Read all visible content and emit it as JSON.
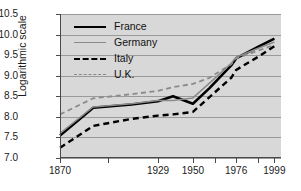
{
  "chart_data": {
    "type": "line",
    "title": "",
    "xlabel": "",
    "ylabel": "Logarithmic scale",
    "grid": true,
    "legend_position": "top-left",
    "ylim": [
      7.0,
      10.5
    ],
    "yticks": [
      "7.0",
      "7.5",
      "8.0",
      "8.5",
      "9.0",
      "9.5",
      "10.0",
      "10.5"
    ],
    "ytick_values": [
      7.0,
      7.5,
      8.0,
      8.5,
      9.0,
      9.5,
      10.0,
      10.5
    ],
    "xticks": [
      "1870",
      "1929",
      "1950",
      "1976",
      "1999"
    ],
    "xtick_values": [
      1870,
      1929,
      1950,
      1976,
      1999
    ],
    "x": [
      1870,
      1890,
      1913,
      1929,
      1938,
      1950,
      1960,
      1973,
      1976,
      1990,
      1999
    ],
    "series": [
      {
        "name": "France",
        "color": "#000000",
        "style": "solid",
        "width": 2.6,
        "values": [
          7.55,
          8.22,
          8.3,
          8.38,
          8.5,
          8.32,
          8.7,
          9.25,
          9.42,
          9.72,
          9.9
        ]
      },
      {
        "name": "Germany",
        "color": "#8a8a8a",
        "style": "solid",
        "width": 1.5,
        "values": [
          7.6,
          8.24,
          8.32,
          8.4,
          8.4,
          8.46,
          8.82,
          9.3,
          9.45,
          9.68,
          9.82
        ]
      },
      {
        "name": "Italy",
        "color": "#000000",
        "style": "dashed",
        "width": 2.4,
        "values": [
          7.25,
          7.78,
          7.95,
          8.03,
          8.06,
          8.12,
          8.48,
          8.95,
          9.14,
          9.48,
          9.72
        ]
      },
      {
        "name": "U.K.",
        "color": "#8a8a8a",
        "style": "dashed",
        "width": 1.8,
        "values": [
          8.06,
          8.45,
          8.55,
          8.63,
          8.72,
          8.8,
          8.95,
          9.28,
          9.42,
          9.62,
          9.75
        ]
      }
    ]
  },
  "legend": {
    "items": [
      {
        "label": "France"
      },
      {
        "label": "Germany"
      },
      {
        "label": "Italy"
      },
      {
        "label": "U.K."
      }
    ]
  }
}
